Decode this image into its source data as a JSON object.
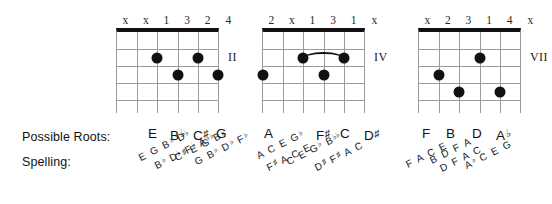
{
  "labels": {
    "possible_roots": "Possible Roots:",
    "spelling": "Spelling:"
  },
  "diagrams": [
    {
      "id": "chord-1",
      "position_marker": "II",
      "fingering": [
        "x",
        "x",
        "1",
        "3",
        "2",
        "4"
      ],
      "strings": 6,
      "frets": 5,
      "barre": null,
      "dots": [
        {
          "string": 3,
          "fret": 2
        },
        {
          "string": 5,
          "fret": 2
        },
        {
          "string": 4,
          "fret": 3
        },
        {
          "string": 6,
          "fret": 3
        }
      ],
      "possible_roots": [
        "E",
        "B♭",
        "C♯",
        "G"
      ],
      "spellings": [
        [
          "E",
          "G",
          "B♭",
          "D♭"
        ],
        [
          "B♭",
          "D♭",
          "F♭",
          "A♭♭"
        ],
        [
          "C♯",
          "E",
          "G",
          "B♭"
        ],
        [
          "G",
          "B♭",
          "D♭",
          "F♭"
        ]
      ]
    },
    {
      "id": "chord-2",
      "position_marker": "IV",
      "fingering": [
        "2",
        "x",
        "1",
        "3",
        "1",
        "x"
      ],
      "strings": 6,
      "frets": 5,
      "barre": {
        "fret": 2,
        "from_string": 3,
        "to_string": 5
      },
      "dots": [
        {
          "string": 3,
          "fret": 2
        },
        {
          "string": 5,
          "fret": 2
        },
        {
          "string": 1,
          "fret": 3
        },
        {
          "string": 4,
          "fret": 3
        }
      ],
      "possible_roots": [
        "A",
        "F♯",
        "C",
        "D♯"
      ],
      "spellings": [
        [
          "A",
          "C",
          "E",
          "G♭"
        ],
        [
          "F♯",
          "A",
          "C",
          "E"
        ],
        [
          "C",
          "E",
          "G♭",
          "B♭♭"
        ],
        [
          "D♯",
          "F♯",
          "A",
          "C"
        ]
      ]
    },
    {
      "id": "chord-3",
      "position_marker": "VII",
      "fingering": [
        "x",
        "2",
        "3",
        "1",
        "4",
        "x"
      ],
      "strings": 6,
      "frets": 5,
      "barre": null,
      "dots": [
        {
          "string": 4,
          "fret": 2
        },
        {
          "string": 2,
          "fret": 3
        },
        {
          "string": 3,
          "fret": 4
        },
        {
          "string": 5,
          "fret": 4
        }
      ],
      "possible_roots": [
        "F",
        "B",
        "D",
        "A♭"
      ],
      "spellings": [
        [
          "F",
          "A",
          "C",
          "E"
        ],
        [
          "B",
          "D",
          "F",
          "A"
        ],
        [
          "D",
          "F",
          "A",
          "C"
        ],
        [
          "A♭",
          "C",
          "E",
          "G"
        ]
      ]
    }
  ]
}
